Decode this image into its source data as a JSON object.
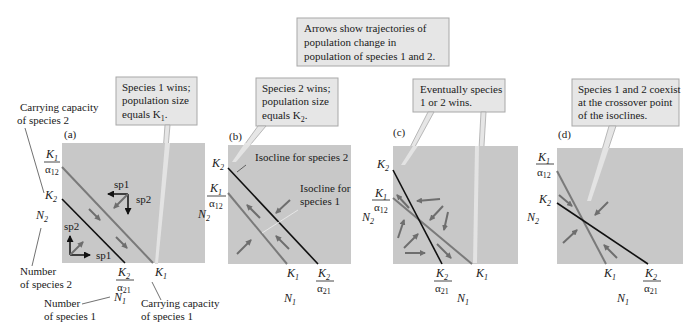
{
  "header_callout": {
    "lines": [
      "Arrows show trajectories of",
      "population change in",
      "population of species 1 and 2."
    ]
  },
  "colors": {
    "plot_bg": "#c8c8c8",
    "callout_bg": "#e6e6e6",
    "callout_border": "#a8a8a8",
    "isocline_species1": "#7a7a7a",
    "isocline_species2": "#111111",
    "arrow": "#6e6e6e"
  },
  "labels": {
    "carrying_capacity_sp2": [
      "Carrying capacity",
      "of species 2"
    ],
    "carrying_capacity_sp1": [
      "Carrying capacity",
      "of species 1"
    ],
    "number_sp2": [
      "Number",
      "of species 2"
    ],
    "number_sp1": [
      "Number",
      "of species 1"
    ],
    "K1": "K",
    "K1_sub": "1",
    "K2": "K",
    "K2_sub": "2",
    "alpha12": "α",
    "alpha12_sub": "12",
    "alpha21": "α",
    "alpha21_sub": "21",
    "N1": "N",
    "N1_sub": "1",
    "N2": "N",
    "N2_sub": "2",
    "sp1": "sp1",
    "sp2": "sp2"
  },
  "panels": [
    {
      "id": "a",
      "label": "(a)",
      "callout": [
        "Species 1 wins;",
        "population size",
        "equals K",
        "1",
        "."
      ]
    },
    {
      "id": "b",
      "label": "(b)",
      "callout": [
        "Species 2 wins;",
        "population size",
        "equals K",
        "2",
        "."
      ],
      "annotations": [
        "Isocline for species 2",
        "Isocline for",
        "species 1"
      ]
    },
    {
      "id": "c",
      "label": "(c)",
      "callout": [
        "Eventually species",
        "1 or 2 wins."
      ]
    },
    {
      "id": "d",
      "label": "(d)",
      "callout": [
        "Species 1 and 2 coexist",
        "at the crossover point",
        "of the isoclines."
      ]
    }
  ]
}
